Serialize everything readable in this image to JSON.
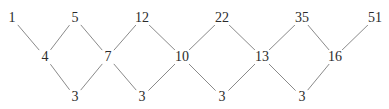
{
  "diagram": {
    "type": "difference-lattice",
    "line_color": "#8a8a8a",
    "text_color": "#2b2b2b",
    "rows": {
      "top": [
        {
          "id": "t0",
          "value": "1",
          "x": 12,
          "y": 18
        },
        {
          "id": "t1",
          "value": "5",
          "x": 75,
          "y": 18
        },
        {
          "id": "t2",
          "value": "12",
          "x": 142,
          "y": 18
        },
        {
          "id": "t3",
          "value": "22",
          "x": 222,
          "y": 18
        },
        {
          "id": "t4",
          "value": "35",
          "x": 302,
          "y": 18
        },
        {
          "id": "t5",
          "value": "51",
          "x": 375,
          "y": 18
        }
      ],
      "middle": [
        {
          "id": "m0",
          "value": "4",
          "x": 45,
          "y": 57
        },
        {
          "id": "m1",
          "value": "7",
          "x": 108,
          "y": 57
        },
        {
          "id": "m2",
          "value": "10",
          "x": 182,
          "y": 57
        },
        {
          "id": "m3",
          "value": "13",
          "x": 262,
          "y": 57
        },
        {
          "id": "m4",
          "value": "16",
          "x": 335,
          "y": 57
        }
      ],
      "bottom": [
        {
          "id": "b0",
          "value": "3",
          "x": 75,
          "y": 97
        },
        {
          "id": "b1",
          "value": "3",
          "x": 142,
          "y": 97
        },
        {
          "id": "b2",
          "value": "3",
          "x": 222,
          "y": 97
        },
        {
          "id": "b3",
          "value": "3",
          "x": 302,
          "y": 97
        }
      ]
    },
    "edges": [
      [
        "t0",
        "m0"
      ],
      [
        "t1",
        "m0"
      ],
      [
        "t1",
        "m1"
      ],
      [
        "t2",
        "m1"
      ],
      [
        "t2",
        "m2"
      ],
      [
        "t3",
        "m2"
      ],
      [
        "t3",
        "m3"
      ],
      [
        "t4",
        "m3"
      ],
      [
        "t4",
        "m4"
      ],
      [
        "t5",
        "m4"
      ],
      [
        "m0",
        "b0"
      ],
      [
        "m1",
        "b0"
      ],
      [
        "m1",
        "b1"
      ],
      [
        "m2",
        "b1"
      ],
      [
        "m2",
        "b2"
      ],
      [
        "m3",
        "b2"
      ],
      [
        "m3",
        "b3"
      ],
      [
        "m4",
        "b3"
      ]
    ]
  }
}
